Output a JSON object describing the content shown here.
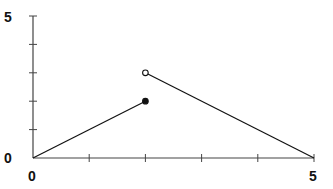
{
  "chart_data": {
    "type": "line",
    "title": "",
    "xlabel": "",
    "ylabel": "",
    "xlim": [
      0,
      5
    ],
    "ylim": [
      0,
      5
    ],
    "grid": false,
    "legend": null,
    "x_tick_labels": [
      "0",
      "5"
    ],
    "y_tick_labels": [
      "0",
      "5"
    ],
    "x_ticks": [
      0,
      1,
      2,
      3,
      4,
      5
    ],
    "y_ticks": [
      0,
      1,
      2,
      3,
      4,
      5
    ],
    "series": [
      {
        "name": "segment-1",
        "x": [
          0,
          2
        ],
        "y": [
          0,
          2
        ],
        "endpoint_end": "closed"
      },
      {
        "name": "segment-2",
        "x": [
          2,
          5
        ],
        "y": [
          3,
          0
        ],
        "endpoint_start": "open"
      }
    ],
    "annotations": [
      {
        "type": "closed-dot",
        "x": 2,
        "y": 2
      },
      {
        "type": "open-dot",
        "x": 2,
        "y": 3
      }
    ]
  },
  "labels": {
    "x_min": "0",
    "x_max": "5",
    "y_min": "0",
    "y_max": "5"
  },
  "colors": {
    "line": "#111111",
    "axis": "#444444"
  }
}
